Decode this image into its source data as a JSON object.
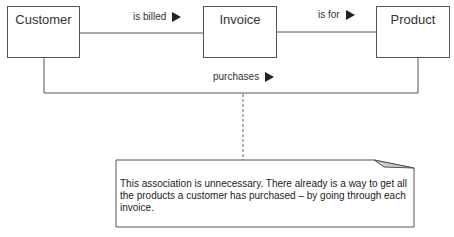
{
  "classes": [
    {
      "id": "customer",
      "label": "Customer"
    },
    {
      "id": "invoice",
      "label": "Invoice"
    },
    {
      "id": "product",
      "label": "Product"
    }
  ],
  "associations": [
    {
      "from": "Customer",
      "to": "Invoice",
      "label": "is billed",
      "direction_icon": "triangle-right-icon"
    },
    {
      "from": "Invoice",
      "to": "Product",
      "label": "is for",
      "direction_icon": "triangle-right-icon"
    },
    {
      "from": "Customer",
      "to": "Product",
      "label": "purchases",
      "direction_icon": "triangle-right-icon"
    }
  ],
  "note": {
    "text": "This association is unnecessary.  There already is a way to get all the products a customer has purchased – by going through each invoice.",
    "attached_to": "purchases"
  },
  "colors": {
    "line": "#555555",
    "text": "#222222",
    "background": "#ffffff"
  }
}
